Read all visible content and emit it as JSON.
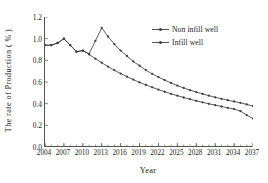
{
  "chart_data": {
    "type": "line",
    "title": "",
    "xlabel": "Year",
    "ylabel": "The rate of  Production  ( % )",
    "xlim": [
      2004,
      2037
    ],
    "ylim": [
      0.0,
      1.2
    ],
    "grid": false,
    "legend_position": "top-right",
    "xticklabels": [
      "2004",
      "2007",
      "2010",
      "2013",
      "2016",
      "2019",
      "2022",
      "2025",
      "2028",
      "2031",
      "2034",
      "2037"
    ],
    "xtickvalues": [
      2004,
      2007,
      2010,
      2013,
      2016,
      2019,
      2022,
      2025,
      2028,
      2031,
      2034,
      2037
    ],
    "yticklabels": [
      "0.0",
      "0.2",
      "0.4",
      "0.6",
      "0.8",
      "1.0",
      "1.2"
    ],
    "ytickvalues": [
      0.0,
      0.2,
      0.4,
      0.6,
      0.8,
      1.0,
      1.2
    ],
    "x": [
      2004,
      2005,
      2006,
      2007,
      2008,
      2009,
      2010,
      2011,
      2012,
      2013,
      2014,
      2015,
      2016,
      2017,
      2018,
      2019,
      2020,
      2021,
      2022,
      2023,
      2024,
      2025,
      2026,
      2027,
      2028,
      2029,
      2030,
      2031,
      2032,
      2033,
      2034,
      2035,
      2036,
      2037
    ],
    "series": [
      {
        "name": "Non infill well",
        "color": "#3f3f3f",
        "marker": "dot",
        "values": [
          0.94,
          0.94,
          0.96,
          1.0,
          0.94,
          0.88,
          0.89,
          0.86,
          0.98,
          1.1,
          1.02,
          0.95,
          0.89,
          0.84,
          0.79,
          0.75,
          0.71,
          0.675,
          0.645,
          0.617,
          0.591,
          0.567,
          0.545,
          0.525,
          0.507,
          0.49,
          0.474,
          0.459,
          0.445,
          0.432,
          0.42,
          0.408,
          0.393,
          0.378
        ]
      },
      {
        "name": "Infill well",
        "color": "#3f3f3f",
        "marker": "dot",
        "values": [
          0.94,
          0.94,
          0.96,
          1.0,
          0.94,
          0.88,
          0.89,
          0.855,
          0.815,
          0.778,
          0.742,
          0.709,
          0.678,
          0.649,
          0.622,
          0.597,
          0.573,
          0.551,
          0.53,
          0.51,
          0.491,
          0.474,
          0.457,
          0.441,
          0.426,
          0.412,
          0.399,
          0.386,
          0.374,
          0.362,
          0.35,
          0.332,
          0.295,
          0.262
        ]
      }
    ]
  },
  "legend": {
    "items": [
      {
        "label": "Non infill well"
      },
      {
        "label": "Infill well"
      }
    ]
  },
  "axes": {
    "x_title": "Year",
    "y_title": "The rate of  Production  ( % )"
  }
}
